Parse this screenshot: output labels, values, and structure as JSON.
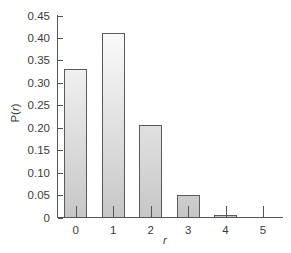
{
  "chart_data": {
    "type": "bar",
    "title": "",
    "xlabel": "r",
    "ylabel": "P(r)",
    "categories": [
      "0",
      "1",
      "2",
      "3",
      "4",
      "5"
    ],
    "values": [
      0.33,
      0.41,
      0.205,
      0.05,
      0.005,
      0.0
    ],
    "ylim": [
      0,
      0.45
    ],
    "yticks": [
      "0",
      "0.05",
      "0.10",
      "0.15",
      "0.20",
      "0.25",
      "0.30",
      "0.35",
      "0.40",
      "0.45"
    ],
    "grid": false,
    "legend": null
  },
  "axis": {
    "ylabel_prefix": "P(",
    "ylabel_var": "r",
    "ylabel_suffix": ")",
    "xlabel": "r"
  },
  "colors": {
    "bar_top": "#ffffff",
    "bar_bottom": "#c6c6c6",
    "outline": "#5a5a5a"
  }
}
